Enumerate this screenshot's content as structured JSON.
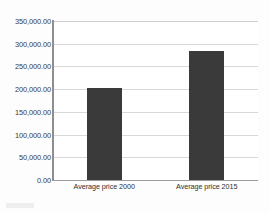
{
  "chart_data": {
    "type": "bar",
    "title": "",
    "xlabel": "",
    "ylabel": "",
    "categories": [
      "Average price 2000",
      "Average price 2015"
    ],
    "values": [
      203000,
      285000
    ],
    "series": [
      {
        "name": "Average price",
        "values": [
          203000,
          285000
        ]
      }
    ],
    "ylim": [
      0,
      350000
    ],
    "yticks": [
      0,
      50000,
      100000,
      150000,
      200000,
      250000,
      300000,
      350000
    ],
    "ytick_labels": [
      "0.00",
      "50,000.00",
      "100,000.00",
      "150,000.00",
      "200,000.00",
      "250,000.00",
      "300,000.00",
      "350,000.00"
    ],
    "grid": true,
    "grid_axis": "y",
    "legend": false,
    "legend_position": "none",
    "bar_color": "#3a3a3a",
    "gridline_color": "#d8d8d8",
    "axis_color": "#8e8e8e",
    "plot_background": "#ffffff",
    "page_background": "#fdfdfd"
  }
}
